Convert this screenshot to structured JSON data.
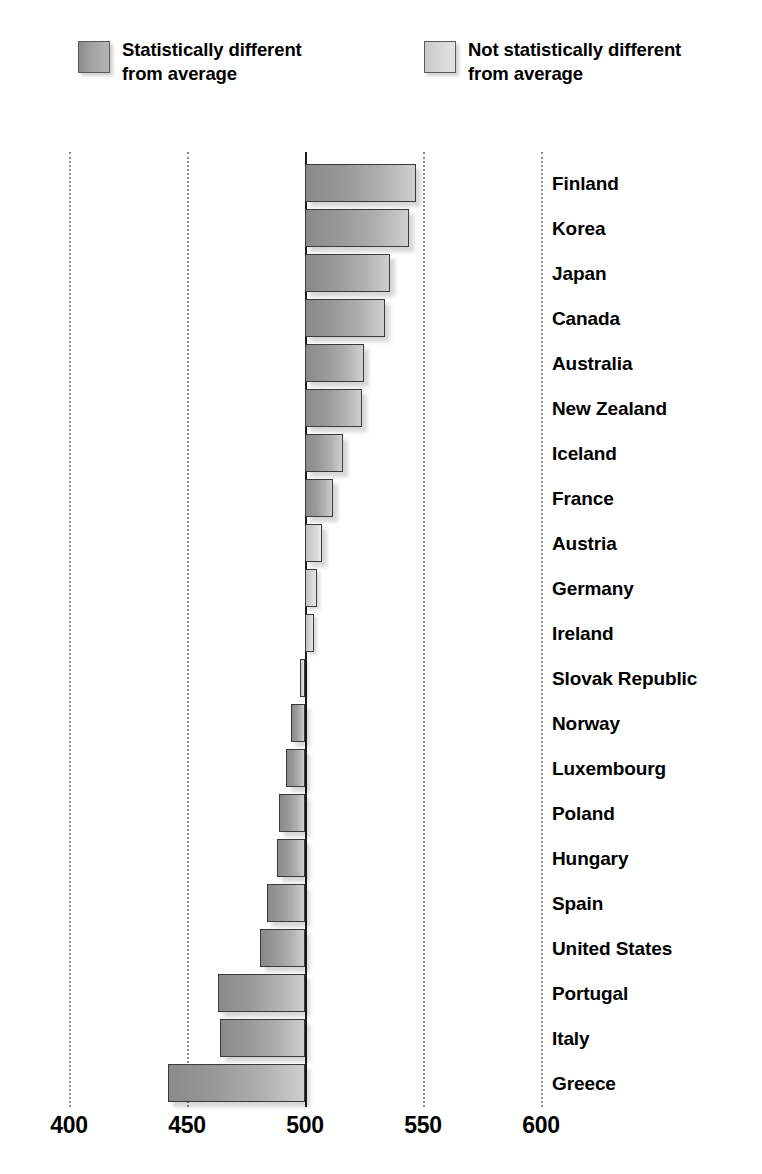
{
  "legend": {
    "items": [
      {
        "key": "different",
        "label": "Statistically different\nfrom average",
        "swatch": "dark-gradient-swatch",
        "color": "#9a9a9a"
      },
      {
        "key": "not-different",
        "label": "Not statistically different\nfrom average",
        "swatch": "light-gradient-swatch",
        "color": "#d8d8d8"
      }
    ]
  },
  "chart_data": {
    "type": "bar",
    "orientation": "horizontal",
    "title": "",
    "subtitle": "",
    "xlabel": "",
    "ylabel": "",
    "xlim": [
      400,
      600
    ],
    "xticks": [
      400,
      450,
      500,
      550,
      600
    ],
    "xtick_labels": [
      "400",
      "450",
      "500",
      "550",
      "600"
    ],
    "baseline": 500,
    "grid": true,
    "grid_axis": "x",
    "grid_style": "dotted",
    "legend_position": "top",
    "categories": [
      "Finland",
      "Korea",
      "Japan",
      "Canada",
      "Australia",
      "New Zealand",
      "Iceland",
      "France",
      "Austria",
      "Germany",
      "Ireland",
      "Slovak Republic",
      "Norway",
      "Luxembourg",
      "Poland",
      "Hungary",
      "Spain",
      "United States",
      "Portugal",
      "Italy",
      "Greece"
    ],
    "values": [
      547,
      544,
      536,
      534,
      525,
      524,
      516,
      512,
      507,
      505,
      504,
      498,
      494,
      492,
      489,
      488,
      484,
      481,
      463,
      464,
      442
    ],
    "significance": [
      "different",
      "different",
      "different",
      "different",
      "different",
      "different",
      "different",
      "different",
      "not-different",
      "not-different",
      "not-different",
      "not-different",
      "different",
      "different",
      "different",
      "different",
      "different",
      "different",
      "different",
      "different",
      "different"
    ]
  }
}
